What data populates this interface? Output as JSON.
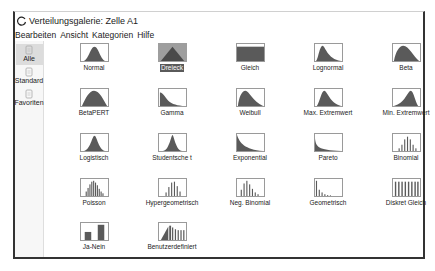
{
  "window": {
    "title": "Verteilungsgalerie: Zelle A1",
    "app_icon": "circle-arrow-icon"
  },
  "menu": [
    "Bearbeiten",
    "Ansicht",
    "Kategorien",
    "Hilfe"
  ],
  "sidebar": {
    "items": [
      {
        "label": "Alle",
        "icon": "page-icon",
        "active": true
      },
      {
        "label": "Standard",
        "icon": "page-icon",
        "active": false
      },
      {
        "label": "Favoriten",
        "icon": "page-icon",
        "active": false
      }
    ]
  },
  "gallery": {
    "selected": "Dreieck",
    "tiles": [
      {
        "label": "Normal",
        "shape": "normal"
      },
      {
        "label": "Dreieck",
        "shape": "triangle"
      },
      {
        "label": "Gleich",
        "shape": "uniform"
      },
      {
        "label": "Lognormal",
        "shape": "lognormal"
      },
      {
        "label": "Beta",
        "shape": "beta"
      },
      {
        "label": "BetaPERT",
        "shape": "betapert"
      },
      {
        "label": "Gamma",
        "shape": "gamma"
      },
      {
        "label": "Weibull",
        "shape": "weibull"
      },
      {
        "label": "Max. Extremwert",
        "shape": "maxext"
      },
      {
        "label": "Min. Extremwert",
        "shape": "minext"
      },
      {
        "label": "Logistisch",
        "shape": "logistic"
      },
      {
        "label": "Studentsche t",
        "shape": "student"
      },
      {
        "label": "Exponential",
        "shape": "exponential"
      },
      {
        "label": "Pareto",
        "shape": "pareto"
      },
      {
        "label": "Binomial",
        "shape": "binomial"
      },
      {
        "label": "Poisson",
        "shape": "poisson"
      },
      {
        "label": "Hypergeometrisch",
        "shape": "hypergeo"
      },
      {
        "label": "Neg. Binomial",
        "shape": "negbinomial"
      },
      {
        "label": "Geometrisch",
        "shape": "geometric"
      },
      {
        "label": "Diskret Gleich",
        "shape": "discreteuniform"
      },
      {
        "label": "Ja-Nein",
        "shape": "yesno"
      },
      {
        "label": "Benutzerdefiniert",
        "shape": "custom"
      }
    ]
  },
  "colors": {
    "fill": "#5a5a5a",
    "selected_bg": "#9e9e9e",
    "selected_label_bg": "#5a5a5a"
  }
}
